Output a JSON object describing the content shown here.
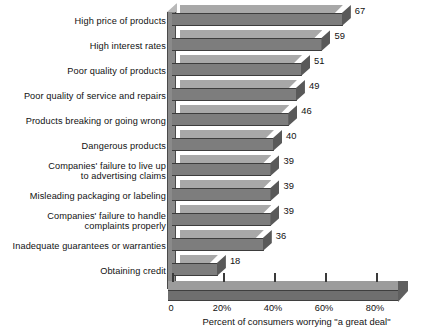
{
  "chart_data": {
    "type": "bar",
    "orientation": "horizontal",
    "title": "",
    "xlabel": "Percent of consumers worrying \"a great deal\"",
    "ylabel": "",
    "xlim": [
      0,
      90
    ],
    "grid": false,
    "legend": null,
    "categories": [
      "High price of products",
      "High interest rates",
      "Poor quality of products",
      "Poor quality of service and repairs",
      "Products breaking or going wrong",
      "Dangerous products",
      "Companies' failure to live up\nto advertising claims",
      "Misleading packaging or labeling",
      "Companies' failure to handle\ncomplaints properly",
      "Inadequate guarantees or warranties",
      "Obtaining credit"
    ],
    "values": [
      67,
      59,
      51,
      49,
      46,
      40,
      39,
      39,
      39,
      36,
      18
    ],
    "value_labels": [
      "67",
      "59",
      "51",
      "49",
      "46",
      "40",
      "39",
      "39",
      "39",
      "36",
      "18"
    ],
    "xticks": [
      0,
      20,
      40,
      60,
      80
    ],
    "xticklabels": [
      "0",
      "20%",
      "40%",
      "60%",
      "80%"
    ],
    "bar_color": "#7d7d7d",
    "bar_top_color": "#a8a8a8",
    "bar_side_color": "#595959",
    "axis_color": "#3a3a3a",
    "background": "#ffffff"
  }
}
